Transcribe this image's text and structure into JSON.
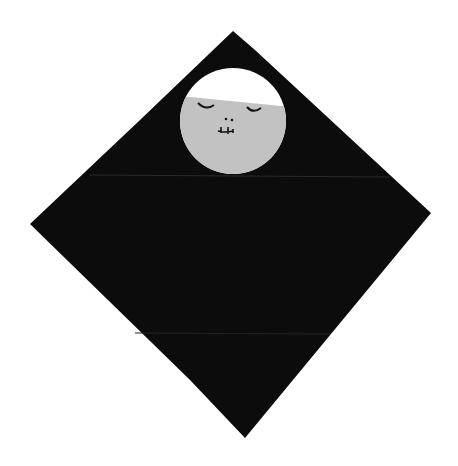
{
  "scene": {
    "description": "Origami paper doll: black diamond-shaped kimono body with a circular face cutout",
    "colors": {
      "background": "#ffffff",
      "body": "#0d0c0c",
      "face": "#c2c2c2",
      "hair": "#ffffff",
      "features": "#111111",
      "fold_line": "#2a2a2a"
    }
  }
}
